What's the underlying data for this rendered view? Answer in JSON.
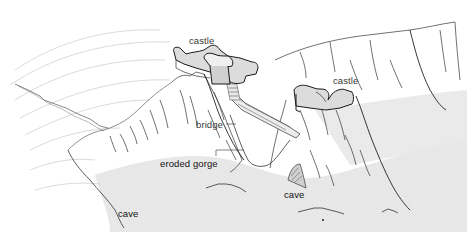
{
  "diagram": {
    "style": "black ink line drawing with grey stippled water",
    "colors": {
      "ink": "#1a1a1a",
      "faint_line": "#9a9a9a",
      "water": "#e6e6e6",
      "castle_fill": "#d8d8d8",
      "background": "#ffffff"
    },
    "labels": [
      {
        "id": "castle_left",
        "text": "castle",
        "x": 189,
        "y": 34
      },
      {
        "id": "castle_right",
        "text": "castle",
        "x": 333,
        "y": 74
      },
      {
        "id": "bridge",
        "text": "bridge",
        "x": 196,
        "y": 119
      },
      {
        "id": "eroded_gorge",
        "text": "eroded gorge",
        "x": 160,
        "y": 157
      },
      {
        "id": "cave_center",
        "text": "cave",
        "x": 284,
        "y": 188
      },
      {
        "id": "cave_left",
        "text": "cave",
        "x": 118,
        "y": 208
      }
    ]
  }
}
